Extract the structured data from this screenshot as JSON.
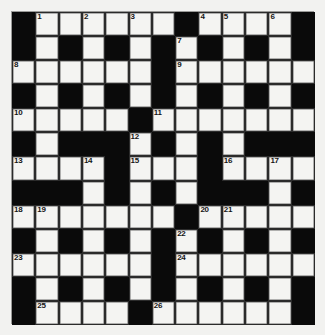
{
  "puzzle": {
    "type": "crossword-grid",
    "title": "Crossword Puzzle Grid",
    "rows": 13,
    "columns": 13,
    "colors": {
      "block": "#0a0a0a",
      "open_cell": "#f4f4f2",
      "grid_line": "#2b2b2b",
      "page_background": "#f2f2f0",
      "number_text": "#151515"
    },
    "legend": {
      "block_symbol": "#",
      "open_symbol": "."
    },
    "grid": [
      "#......#....#",
      "#.#.#.#.#.#.#",
      "......#......",
      "#.#.#.#.#.#.#",
      ".....#.......",
      "#.###.#.#.###",
      "....#...#....",
      "###.#.#.###.#",
      ".......#.....",
      "#.#.#.#.#.#.#",
      "......#......",
      "#.#.#.#.#.#.#",
      "#....#......#"
    ],
    "numbers": [
      {
        "n": 1,
        "row": 0,
        "col": 1
      },
      {
        "n": 2,
        "row": 0,
        "col": 3
      },
      {
        "n": 3,
        "row": 0,
        "col": 5
      },
      {
        "n": 4,
        "row": 0,
        "col": 8
      },
      {
        "n": 5,
        "row": 0,
        "col": 9
      },
      {
        "n": 6,
        "row": 0,
        "col": 11
      },
      {
        "n": 7,
        "row": 1,
        "col": 7
      },
      {
        "n": 8,
        "row": 2,
        "col": 0
      },
      {
        "n": 9,
        "row": 2,
        "col": 7
      },
      {
        "n": 10,
        "row": 4,
        "col": 0
      },
      {
        "n": 11,
        "row": 4,
        "col": 6
      },
      {
        "n": 12,
        "row": 5,
        "col": 5
      },
      {
        "n": 13,
        "row": 6,
        "col": 0
      },
      {
        "n": 14,
        "row": 6,
        "col": 3
      },
      {
        "n": 15,
        "row": 6,
        "col": 5
      },
      {
        "n": 16,
        "row": 6,
        "col": 9
      },
      {
        "n": 17,
        "row": 6,
        "col": 11
      },
      {
        "n": 18,
        "row": 8,
        "col": 0
      },
      {
        "n": 19,
        "row": 8,
        "col": 1
      },
      {
        "n": 20,
        "row": 8,
        "col": 8
      },
      {
        "n": 21,
        "row": 8,
        "col": 9
      },
      {
        "n": 22,
        "row": 9,
        "col": 7
      },
      {
        "n": 23,
        "row": 10,
        "col": 0
      },
      {
        "n": 24,
        "row": 10,
        "col": 7
      },
      {
        "n": 25,
        "row": 12,
        "col": 1
      },
      {
        "n": 26,
        "row": 12,
        "col": 6
      }
    ],
    "entries": []
  }
}
